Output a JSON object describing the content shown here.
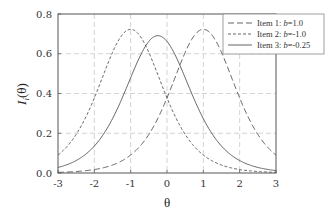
{
  "chart_data": {
    "type": "line",
    "title": "",
    "xlabel": "θ",
    "ylabel": "I_i(θ)",
    "xlim": [
      -3,
      3
    ],
    "ylim": [
      0,
      0.8
    ],
    "xticks": [
      "-3",
      "-2",
      "-1",
      "0",
      "1",
      "2",
      "3"
    ],
    "yticks": [
      "0.0",
      "0.2",
      "0.4",
      "0.6",
      "0.8"
    ],
    "grid": true,
    "legend_position": "upper right",
    "x": [
      -3,
      -2.5,
      -2,
      -1.5,
      -1,
      -0.5,
      0,
      0.5,
      1,
      1.5,
      2,
      2.5,
      3
    ],
    "series": [
      {
        "name": "Item 1: b=1.0",
        "b": 1.0,
        "style": "long-dash",
        "values": [
          0.003,
          0.008,
          0.018,
          0.04,
          0.09,
          0.194,
          0.378,
          0.606,
          0.723,
          0.606,
          0.378,
          0.194,
          0.09
        ]
      },
      {
        "name": "Item 2: b=-1.0",
        "b": -1.0,
        "style": "short-dash",
        "values": [
          0.09,
          0.194,
          0.378,
          0.606,
          0.723,
          0.606,
          0.378,
          0.194,
          0.09,
          0.04,
          0.018,
          0.008,
          0.003
        ]
      },
      {
        "name": "Item 3: b=-0.25",
        "b": -0.25,
        "style": "solid",
        "values": [
          0.027,
          0.06,
          0.134,
          0.275,
          0.493,
          0.691,
          0.691,
          0.493,
          0.275,
          0.134,
          0.06,
          0.027,
          0.011
        ]
      }
    ]
  },
  "legend": {
    "items": [
      {
        "prefix": "Item 1: ",
        "var": "b",
        "suffix": "=1.0"
      },
      {
        "prefix": "Item 2: ",
        "var": "b",
        "suffix": "=-1.0"
      },
      {
        "prefix": "Item 3: ",
        "var": "b",
        "suffix": "=-0.25"
      }
    ]
  },
  "axes": {
    "xlabel": "θ",
    "ylabel_main": "I",
    "ylabel_sub": "i",
    "ylabel_arg": "(θ)"
  },
  "colors": {
    "curve": "#555555",
    "axis": "#444444",
    "grid": "#c8c8c8"
  }
}
